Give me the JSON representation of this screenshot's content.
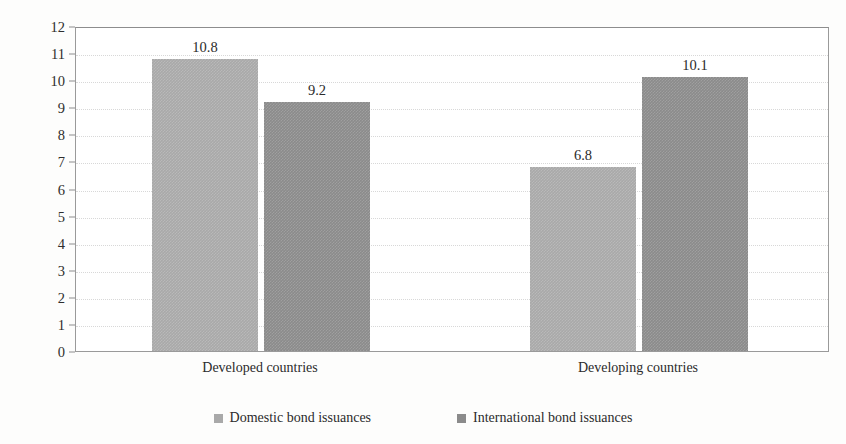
{
  "chart_data": {
    "type": "bar",
    "title": "",
    "xlabel": "",
    "ylabel": "Maturity in years",
    "ylim": [
      0,
      12
    ],
    "ytick_labels": [
      "12",
      "11",
      "10",
      "9",
      "8",
      "7",
      "6",
      "5",
      "4",
      "3",
      "2",
      "1",
      "0"
    ],
    "ytick_values": [
      12,
      11,
      10,
      9,
      8,
      7,
      6,
      5,
      4,
      3,
      2,
      1,
      0
    ],
    "grid": "horizontal-dotted",
    "legend_position": "bottom-center",
    "categories": [
      "Developed countries",
      "Developing countries"
    ],
    "series": [
      {
        "name": "Domestic bond issuances",
        "color": "#a9a9a9",
        "values": [
          10.8,
          6.8
        ],
        "labels": [
          "10.8",
          "6.8"
        ]
      },
      {
        "name": "International bond issuances",
        "color": "#8b8b8b",
        "values": [
          9.2,
          10.1
        ],
        "labels": [
          "9.2",
          "10.1"
        ]
      }
    ]
  },
  "axis": {
    "y_title": "Maturity in years"
  },
  "legend": {
    "items": [
      {
        "label": "Domestic bond issuances"
      },
      {
        "label": "International bond issuances"
      }
    ]
  }
}
